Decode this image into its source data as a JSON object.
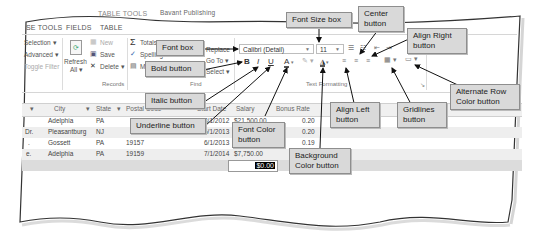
{
  "window": {
    "context_tab_group": "TABLE TOOLS",
    "doc_title": "Bavant Publishing",
    "tabs": [
      {
        "label": "SE TOOLS"
      },
      {
        "label": "FIELDS"
      },
      {
        "label": "TABLE"
      }
    ]
  },
  "ribbon": {
    "sort_filter": {
      "items": [
        {
          "label": "Selection ▾"
        },
        {
          "label": "Advanced ▾"
        },
        {
          "label": "Toggle Filter"
        }
      ]
    },
    "records": {
      "refresh_label": "Refresh",
      "refresh_sub": "All ▾",
      "new_label": "New",
      "save_label": "Save",
      "delete_label": "Delete ▾",
      "group_label": "Records"
    },
    "find": {
      "totals_label": "Totals",
      "spelling_label": "Spelling",
      "more_label": "More ▾",
      "find_label": "Find",
      "replace_label": "Replace",
      "goto_label": "Go To ▾",
      "select_label": "Select ▾",
      "group_label": "Find"
    },
    "text_formatting": {
      "font_name": "Calibri (Detail)",
      "font_size": "11",
      "bold": "B",
      "italic": "I",
      "underline": "U",
      "group_label": "Text Formatting",
      "launcher": "↘"
    }
  },
  "grid": {
    "columns": [
      {
        "label": "City"
      },
      {
        "label": "State"
      },
      {
        "label": "Postal Code"
      },
      {
        "label": "Start Date"
      },
      {
        "label": "Salary"
      },
      {
        "label": "Bonus Rate"
      }
    ],
    "rows": [
      {
        "prefix": "",
        "city": "Adelphia",
        "state": "PA",
        "postal": "",
        "start": "8/1/2012",
        "salary": "$21,500.00",
        "bonus": "0.20"
      },
      {
        "prefix": "Dr.",
        "city": "Pleasantburg",
        "state": "NJ",
        "postal": "",
        "start": "6/1/2013",
        "salary": "",
        "bonus": "0.20"
      },
      {
        "prefix": ".",
        "city": "Gossett",
        "state": "PA",
        "postal": "19157",
        "start": "6/1/2013",
        "salary": "",
        "bonus": "0.19"
      },
      {
        "prefix": "e.",
        "city": "Adelphia",
        "state": "PA",
        "postal": "19159",
        "start": "7/1/2014",
        "salary": "$7,750.00",
        "bonus": ""
      }
    ],
    "new_row_value": "$0.00"
  },
  "callouts": {
    "font_box": "Font box",
    "font_size_box": "Font Size box",
    "center_button": "Center button",
    "align_right_button": "Align Right button",
    "bold_button": "Bold button",
    "italic_button": "Italic button",
    "underline_button": "Underline button",
    "font_color_button": "Font Color button",
    "background_color_button": "Background Color button",
    "align_left_button": "Align Left button",
    "gridlines_button": "Gridlines button",
    "alternate_row_color_button": "Alternate Row Color button"
  }
}
